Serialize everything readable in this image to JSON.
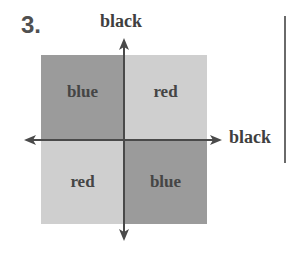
{
  "figure": {
    "number": "3."
  },
  "axes": {
    "vertical_label": "black",
    "horizontal_label": "black"
  },
  "quadrants": [
    {
      "position": "top-left",
      "label": "blue",
      "color": "#9a9a9a"
    },
    {
      "position": "top-right",
      "label": "red",
      "color": "#cdcdcd"
    },
    {
      "position": "bottom-left",
      "label": "red",
      "color": "#cdcdcd"
    },
    {
      "position": "bottom-right",
      "label": "blue",
      "color": "#9a9a9a"
    }
  ],
  "colors": {
    "axis": "#4a4a4a",
    "text": "#454545",
    "background": "#ffffff"
  }
}
